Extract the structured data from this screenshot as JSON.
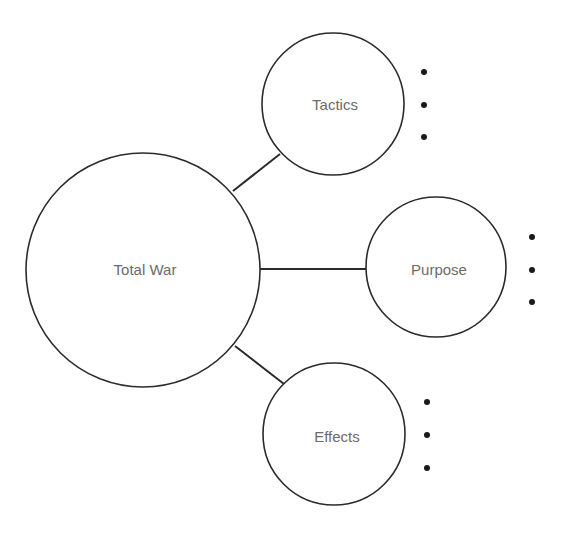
{
  "diagram": {
    "type": "bubble-map",
    "colors": {
      "stroke": "#2b2b2b",
      "label": "#6b6b6b",
      "bullet": "#1a1a1a",
      "background": "#ffffff"
    },
    "center": {
      "label": "Total War"
    },
    "branches": [
      {
        "label": "Tactics",
        "bullets": [
          "",
          "",
          ""
        ]
      },
      {
        "label": "Purpose",
        "bullets": [
          "",
          "",
          ""
        ]
      },
      {
        "label": "Effects",
        "bullets": [
          "",
          "",
          ""
        ]
      }
    ]
  }
}
